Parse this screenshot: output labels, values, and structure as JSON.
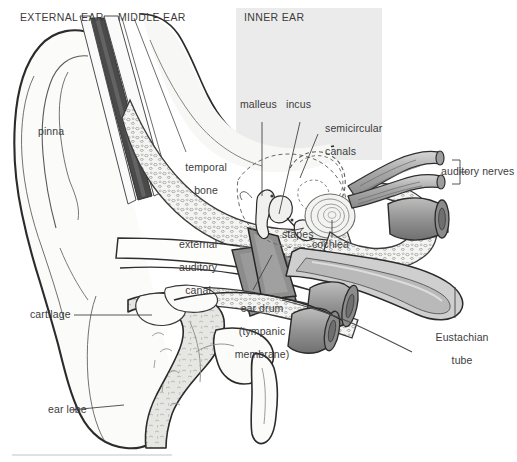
{
  "figure": {
    "regions": [
      {
        "id": "external-ear",
        "label": "EXTERNAL EAR"
      },
      {
        "id": "middle-ear",
        "label": "MIDDLE EAR"
      },
      {
        "id": "inner-ear",
        "label": "INNER EAR"
      }
    ],
    "labels": [
      {
        "id": "pinna",
        "text": "pinna"
      },
      {
        "id": "temporal-bone",
        "text": "temporal\nbone"
      },
      {
        "id": "external-auditory-canal",
        "text": "external\nauditory\ncanal"
      },
      {
        "id": "cartilage",
        "text": "cartilage"
      },
      {
        "id": "ear-lobe",
        "text": "ear lobe"
      },
      {
        "id": "ear-drum",
        "text": "ear drum\n(tympanic\nmembrane)"
      },
      {
        "id": "malleus",
        "text": "malleus"
      },
      {
        "id": "incus",
        "text": "incus"
      },
      {
        "id": "stapes",
        "text": "stapes"
      },
      {
        "id": "semicircular-canals",
        "text": "semicircular\ncanals"
      },
      {
        "id": "cochlea",
        "text": "cochlea"
      },
      {
        "id": "auditory-nerves",
        "text": "auditory nerves"
      },
      {
        "id": "eustachian-tube",
        "text": "Eustachian\ntube"
      }
    ],
    "label_text": {
      "pinna": "pinna",
      "temporal_bone_l1": "temporal",
      "temporal_bone_l2": "bone",
      "eac_l1": "external",
      "eac_l2": "auditory",
      "eac_l3": "canal",
      "cartilage": "cartilage",
      "ear_lobe": "ear lobe",
      "ear_drum_l1": "ear drum",
      "ear_drum_l2": "(tympanic",
      "ear_drum_l3": "membrane)",
      "malleus": "malleus",
      "incus": "incus",
      "stapes": "stapes",
      "semicircular_l1": "semicircular",
      "semicircular_l2": "canals",
      "cochlea": "cochlea",
      "auditory_nerves": "auditory nerves",
      "eustachian_l1": "Eustachian",
      "eustachian_l2": "tube",
      "region_external": "EXTERNAL EAR",
      "region_middle": "MIDDLE EAR",
      "region_inner": "INNER EAR"
    },
    "colors": {
      "background": "#ffffff",
      "inner_ear_panel": "#ebebeb",
      "line": "#333333",
      "thin_line": "#6e6e6e",
      "text": "#3c3c3c",
      "bone_fill": "#f2f2f0",
      "cartilage_fill": "#e2e2df",
      "canal_dark": "#8a8a8a",
      "canal_darkest": "#4a4a4a",
      "nerve_fill": "#b5b5b5",
      "tube_fill": "#9a9a9a",
      "tube_shadow": "#6f6f6f",
      "eardrum_fill": "#8f8f8f",
      "rule": "#bdbdbd"
    }
  }
}
